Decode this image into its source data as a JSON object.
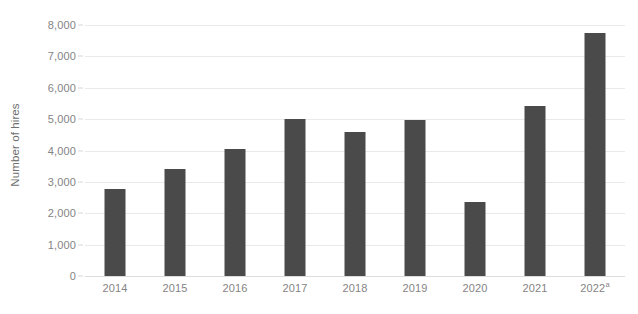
{
  "chart_data": {
    "type": "bar",
    "title": "",
    "xlabel": "",
    "ylabel": "Number of hires",
    "categories": [
      "2014",
      "2015",
      "2016",
      "2017",
      "2018",
      "2019",
      "2020",
      "2021",
      "2022"
    ],
    "category_notes": [
      "",
      "",
      "",
      "",
      "",
      "",
      "",
      "",
      "a"
    ],
    "values": [
      2780,
      3420,
      4060,
      5000,
      4600,
      4980,
      2350,
      5420,
      7750
    ],
    "ylim": [
      0,
      8000
    ],
    "ytick_values": [
      0,
      1000,
      2000,
      3000,
      4000,
      5000,
      6000,
      7000,
      8000
    ],
    "ytick_labels": [
      "0",
      "1,000",
      "2,000",
      "3,000",
      "4,000",
      "5,000",
      "6,000",
      "7,000",
      "8,000"
    ],
    "grid": true,
    "grid_axis": "y",
    "legend": false,
    "legend_position": "none",
    "series": [
      {
        "name": "Number of hires",
        "color": "#4a4a4a",
        "values": [
          2780,
          3420,
          4060,
          5000,
          4600,
          4980,
          2350,
          5420,
          7750
        ]
      }
    ]
  },
  "axes": {
    "y_title": "Number of hires",
    "y_ticks": [
      {
        "label": "8,000",
        "value": 8000
      },
      {
        "label": "7,000",
        "value": 7000
      },
      {
        "label": "6,000",
        "value": 6000
      },
      {
        "label": "5,000",
        "value": 5000
      },
      {
        "label": "4,000",
        "value": 4000
      },
      {
        "label": "3,000",
        "value": 3000
      },
      {
        "label": "2,000",
        "value": 2000
      },
      {
        "label": "1,000",
        "value": 1000
      },
      {
        "label": "0",
        "value": 0
      }
    ],
    "x_ticks": [
      {
        "label": "2014",
        "note": ""
      },
      {
        "label": "2015",
        "note": ""
      },
      {
        "label": "2016",
        "note": ""
      },
      {
        "label": "2017",
        "note": ""
      },
      {
        "label": "2018",
        "note": ""
      },
      {
        "label": "2019",
        "note": ""
      },
      {
        "label": "2020",
        "note": ""
      },
      {
        "label": "2021",
        "note": ""
      },
      {
        "label": "2022",
        "note": "a"
      }
    ]
  },
  "style": {
    "bar_color": "#4a4a4a",
    "grid_color": "#e9e9e9",
    "baseline_color": "#dcdcdc",
    "tick_label_color": "#848484",
    "axis_title_color": "#6f6f6f",
    "background": "#ffffff"
  },
  "title_remnant": ""
}
